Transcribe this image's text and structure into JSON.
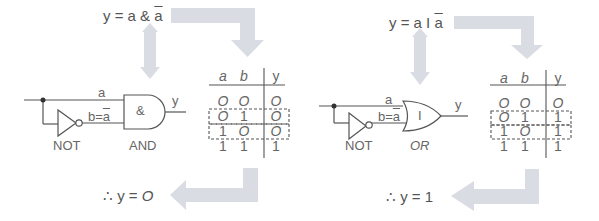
{
  "panels": [
    {
      "expression": "y = a & ā",
      "expr_parts": {
        "lhs": "y = a & ",
        "bar": "a"
      },
      "gate_symbol": "&",
      "not_label": "NOT",
      "gate_label": "AND",
      "input_a_label": "a",
      "input_b_label": "b=",
      "input_b_bar": "a",
      "output_label": "y",
      "conclusion": "∴ y = 0",
      "conclusion_parts": {
        "therefore": "∴",
        "text": "y = ",
        "value": "O"
      },
      "truth_table": {
        "headers": [
          "a",
          "b",
          "y"
        ],
        "rows": [
          [
            "O",
            "O",
            "O"
          ],
          [
            "O",
            "1",
            "O"
          ],
          [
            "1",
            "O",
            "O"
          ],
          [
            "1",
            "1",
            "1"
          ]
        ],
        "highlighted_rows": [
          1,
          2
        ]
      }
    },
    {
      "expression": "y = a | ā",
      "expr_parts": {
        "lhs": "y = a  I ",
        "bar": "a"
      },
      "gate_symbol": "I",
      "not_label": "NOT",
      "gate_label": "OR",
      "input_a_label": "a",
      "input_b_label": "b=",
      "input_b_bar": "a",
      "output_label": "y",
      "conclusion": "∴ y = 1",
      "conclusion_parts": {
        "therefore": "∴",
        "text": "y = ",
        "value": "1"
      },
      "truth_table": {
        "headers": [
          "a",
          "b",
          "y"
        ],
        "rows": [
          [
            "O",
            "O",
            "O"
          ],
          [
            "O",
            "1",
            "1"
          ],
          [
            "1",
            "O",
            "1"
          ],
          [
            "1",
            "1",
            "1"
          ]
        ],
        "highlighted_rows": [
          1,
          2
        ]
      }
    }
  ],
  "colors": {
    "arrow": "#d9dce3",
    "line": "#555555",
    "text": "#555555"
  }
}
